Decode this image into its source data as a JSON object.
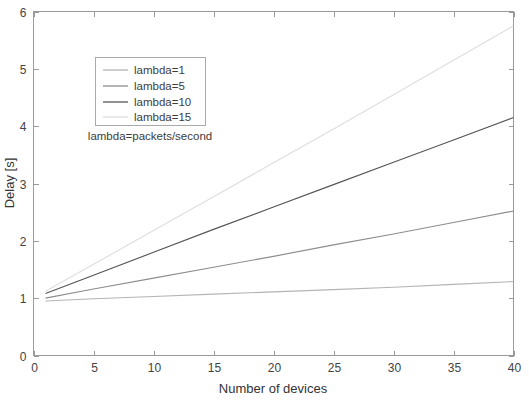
{
  "chart_data": {
    "type": "line",
    "title": "",
    "subtitle": "lambda=packets/second",
    "xlabel": "Number of devices",
    "ylabel": "Delay [s]",
    "xlim": [
      0,
      40
    ],
    "ylim": [
      0,
      6
    ],
    "xticks": [
      0,
      5,
      10,
      15,
      20,
      25,
      30,
      35,
      40
    ],
    "yticks": [
      0,
      1,
      2,
      3,
      4,
      5,
      6
    ],
    "xtick_labels": [
      "0",
      "5",
      "10",
      "15",
      "20",
      "25",
      "30",
      "35",
      "40"
    ],
    "ytick_labels": [
      "0",
      "1",
      "2",
      "3",
      "4",
      "5",
      "6"
    ],
    "grid": false,
    "legend_position": "upper-left-center",
    "x": [
      1,
      5,
      10,
      15,
      20,
      25,
      30,
      35,
      40
    ],
    "series": [
      {
        "name": "lambda=1",
        "color": "#b4b4b4",
        "values": [
          0.95,
          0.99,
          1.03,
          1.07,
          1.11,
          1.15,
          1.19,
          1.24,
          1.29
        ]
      },
      {
        "name": "lambda=5",
        "color": "#8d8d8d",
        "values": [
          1.0,
          1.16,
          1.35,
          1.54,
          1.73,
          1.93,
          2.12,
          2.32,
          2.52
        ]
      },
      {
        "name": "lambda=10",
        "color": "#555555",
        "values": [
          1.08,
          1.4,
          1.8,
          2.2,
          2.59,
          2.98,
          3.37,
          3.76,
          4.15
        ]
      },
      {
        "name": "lambda=15",
        "color": "#dedede",
        "values": [
          1.12,
          1.59,
          2.18,
          2.77,
          3.36,
          3.95,
          4.55,
          5.15,
          5.75
        ]
      }
    ]
  },
  "legend": {
    "entries": [
      {
        "label": "lambda=1"
      },
      {
        "label": "lambda=5"
      },
      {
        "label": "lambda=10"
      },
      {
        "label": "lambda=15"
      }
    ],
    "note": "lambda=packets/second"
  },
  "axes": {
    "x_title": "Number of devices",
    "y_title": "Delay [s]"
  }
}
